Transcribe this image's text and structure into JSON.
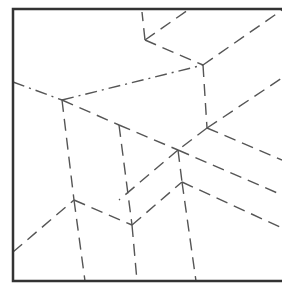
{
  "diagram": {
    "type": "crease-pattern",
    "width": 282,
    "height": 291,
    "colors": {
      "background": "#ffffff",
      "border": "#333333",
      "crease": "#555555"
    },
    "border": {
      "left": 13,
      "top": 9,
      "right": 282,
      "bottom": 281,
      "stroke_width": 2.5
    },
    "vertices": {
      "A": [
        62,
        100
      ],
      "B": [
        119,
        125
      ],
      "C": [
        203,
        65
      ],
      "D": [
        145,
        40
      ],
      "E": [
        207,
        128
      ],
      "F": [
        178,
        150
      ],
      "G": [
        182,
        182
      ],
      "H": [
        74,
        200
      ],
      "I": [
        132,
        225
      ]
    },
    "creases": [
      {
        "from": [
          13,
          82
        ],
        "to": [
          62,
          100
        ],
        "style": "dash-dot"
      },
      {
        "from": [
          62,
          100
        ],
        "to": [
          119,
          125
        ],
        "style": "dash"
      },
      {
        "from": [
          119,
          125
        ],
        "to": [
          178,
          150
        ],
        "style": "dash"
      },
      {
        "from": [
          178,
          150
        ],
        "to": [
          282,
          195
        ],
        "style": "dash"
      },
      {
        "from": [
          62,
          100
        ],
        "to": [
          203,
          65
        ],
        "style": "dash-dot"
      },
      {
        "from": [
          203,
          65
        ],
        "to": [
          282,
          10
        ],
        "style": "dash"
      },
      {
        "from": [
          145,
          40
        ],
        "to": [
          203,
          65
        ],
        "style": "dash"
      },
      {
        "from": [
          145,
          40
        ],
        "to": [
          142,
          12
        ],
        "style": "dash"
      },
      {
        "from": [
          145,
          40
        ],
        "to": [
          188,
          10
        ],
        "style": "dash"
      },
      {
        "from": [
          203,
          65
        ],
        "to": [
          207,
          128
        ],
        "style": "dash"
      },
      {
        "from": [
          207,
          128
        ],
        "to": [
          282,
          78
        ],
        "style": "dash"
      },
      {
        "from": [
          207,
          128
        ],
        "to": [
          282,
          160
        ],
        "style": "dash"
      },
      {
        "from": [
          207,
          128
        ],
        "to": [
          178,
          150
        ],
        "style": "dash"
      },
      {
        "from": [
          119,
          125
        ],
        "to": [
          132,
          225
        ],
        "style": "dash"
      },
      {
        "from": [
          178,
          150
        ],
        "to": [
          182,
          182
        ],
        "style": "dash"
      },
      {
        "from": [
          62,
          100
        ],
        "to": [
          74,
          200
        ],
        "style": "dash"
      },
      {
        "from": [
          74,
          200
        ],
        "to": [
          85,
          281
        ],
        "style": "dash"
      },
      {
        "from": [
          13,
          252
        ],
        "to": [
          74,
          200
        ],
        "style": "dash"
      },
      {
        "from": [
          74,
          200
        ],
        "to": [
          132,
          225
        ],
        "style": "dash"
      },
      {
        "from": [
          132,
          225
        ],
        "to": [
          137,
          281
        ],
        "style": "dash"
      },
      {
        "from": [
          132,
          225
        ],
        "to": [
          182,
          182
        ],
        "style": "dash"
      },
      {
        "from": [
          182,
          182
        ],
        "to": [
          196,
          281
        ],
        "style": "dash"
      },
      {
        "from": [
          182,
          182
        ],
        "to": [
          282,
          228
        ],
        "style": "dash"
      },
      {
        "from": [
          178,
          150
        ],
        "to": [
          119,
          200
        ],
        "style": "dash"
      }
    ]
  }
}
